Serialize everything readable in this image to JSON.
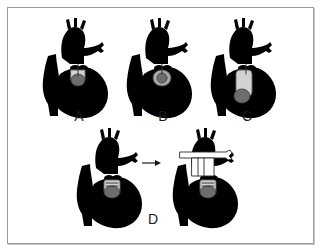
{
  "figure": {
    "panels": [
      {
        "id": "A",
        "label": "A",
        "description": "heart with lesion shading at upper ventricle"
      },
      {
        "id": "B",
        "label": "B",
        "description": "heart with larger shaded lesion"
      },
      {
        "id": "C",
        "label": "C",
        "description": "heart with elongated shaded band in ventricle"
      },
      {
        "id": "D",
        "label": "D",
        "description": "before and after heart pair with transverse vessel"
      }
    ],
    "arrow": {
      "from": "D-before",
      "to": "D-after",
      "glyph": "→"
    }
  },
  "colors": {
    "frame_border": "#9a9a9a",
    "line": "#2a2a2a",
    "shade_dark": "#6d6d6d",
    "shade_mid": "#a9a9a9",
    "shade_light": "#d2d2d2",
    "background": "#ffffff"
  }
}
